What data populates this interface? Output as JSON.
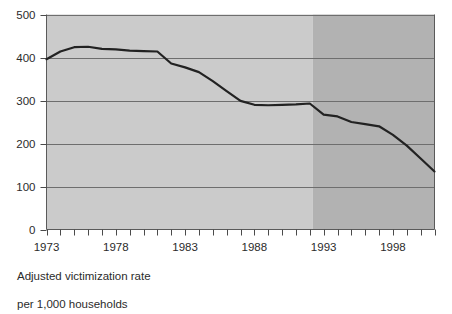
{
  "chart_data": {
    "type": "line",
    "title": "",
    "subtitle": "",
    "xlabel": "",
    "ylabel": "",
    "caption_line1": "Adjusted victimization rate",
    "caption_line2": "per 1,000 households",
    "xlim": [
      1973,
      2001
    ],
    "ylim": [
      0,
      500
    ],
    "ytick_values": [
      0,
      100,
      200,
      300,
      400,
      500
    ],
    "ytick_labels": [
      "0",
      "100",
      "200",
      "300",
      "400",
      "500"
    ],
    "xtick_values": [
      1973,
      1974,
      1975,
      1976,
      1977,
      1978,
      1979,
      1980,
      1981,
      1982,
      1983,
      1984,
      1985,
      1986,
      1987,
      1988,
      1989,
      1990,
      1991,
      1992,
      1993,
      1994,
      1995,
      1996,
      1997,
      1998,
      1999,
      2000,
      2001
    ],
    "xtick_labels_shown": [
      "1973",
      "1978",
      "1983",
      "1988",
      "1993",
      "1998"
    ],
    "xtick_labels_shown_values": [
      1973,
      1978,
      1983,
      1988,
      1993,
      1998
    ],
    "grid": true,
    "grid_axis": "y",
    "legend": "none",
    "series": [
      {
        "name": "Adjusted victimization rate per 1,000 households",
        "x": [
          1973,
          1974,
          1975,
          1976,
          1977,
          1978,
          1979,
          1980,
          1981,
          1982,
          1983,
          1984,
          1985,
          1986,
          1987,
          1988,
          1989,
          1990,
          1991,
          1992,
          1993,
          1994,
          1995,
          1996,
          1997,
          1998,
          1999,
          2000,
          2001
        ],
        "values": [
          396,
          414,
          424,
          425,
          420,
          419,
          416,
          415,
          414,
          386,
          377,
          366,
          345,
          322,
          299,
          290,
          289,
          290,
          291,
          293,
          267,
          263,
          250,
          245,
          240,
          220,
          195,
          165,
          135
        ],
        "color": "#222222",
        "line_width": 2.2
      }
    ],
    "shaded_regions": [
      {
        "name": "light-band",
        "x_start": 1973,
        "x_end": 1992.2,
        "color": "#cbcbcb"
      },
      {
        "name": "dark-band",
        "x_start": 1992.2,
        "x_end": 2001,
        "color": "#b2b2b2"
      }
    ],
    "axis_colors": {
      "gridline": "#6e6e6e",
      "axis": "#4a4a4a",
      "plot_border": "#5a5a5a"
    }
  }
}
